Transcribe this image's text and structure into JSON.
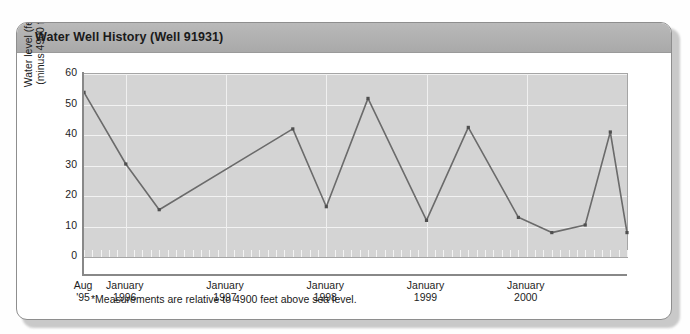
{
  "card": {
    "title": "Water Well History (Well 91931)"
  },
  "footnote": "*Measurements are relative to 4900 feet above sea level.",
  "axes": {
    "y_title_line1": "Water level (feet) *",
    "y_title_line2": "(minus 4900 feet)",
    "y_ticks": [
      "60",
      "50",
      "40",
      "30",
      "20",
      "10",
      "0"
    ]
  },
  "colors": {
    "header_bar": "#b0b0b0",
    "plot_background": "#d4d4d4",
    "gridline": "#f2f2f2",
    "series_line": "#6b6b6b",
    "axis": "#888888",
    "card_border": "#8e8e8e",
    "text": "#1a1a1a"
  },
  "chart_data": {
    "type": "line",
    "title": "Water Well History (Well 91931)",
    "xlabel": "",
    "ylabel": "Water level (feet) * (minus 4900 feet)",
    "ylim": [
      0,
      60
    ],
    "ytick_values": [
      0,
      10,
      20,
      30,
      40,
      50,
      60
    ],
    "grid": true,
    "legend": "none",
    "annotation": "*Measurements are relative to 4900 feet above sea level.",
    "x_tick_labels": [
      {
        "label_line1": "Aug",
        "label_line2": "'95",
        "x": "1995-08"
      },
      {
        "label_line1": "January",
        "label_line2": "1996",
        "x": "1996-01"
      },
      {
        "label_line1": "January",
        "label_line2": "1997",
        "x": "1997-01"
      },
      {
        "label_line1": "January",
        "label_line2": "1998",
        "x": "1998-01"
      },
      {
        "label_line1": "January",
        "label_line2": "1999",
        "x": "1999-01"
      },
      {
        "label_line1": "January",
        "label_line2": "2000",
        "x": "2000-01"
      }
    ],
    "x_axis_range": [
      "1995-08",
      "2001-01"
    ],
    "series": [
      {
        "name": "Water level",
        "points": [
          {
            "x": "1995-08",
            "y": 54
          },
          {
            "x": "1996-01",
            "y": 30.5
          },
          {
            "x": "1996-05",
            "y": 15.5
          },
          {
            "x": "1997-09",
            "y": 42
          },
          {
            "x": "1998-01",
            "y": 16.5
          },
          {
            "x": "1998-06",
            "y": 52
          },
          {
            "x": "1999-01",
            "y": 12
          },
          {
            "x": "1999-06",
            "y": 42.5
          },
          {
            "x": "1999-12",
            "y": 13
          },
          {
            "x": "2000-04",
            "y": 8
          },
          {
            "x": "2000-08",
            "y": 10.5
          },
          {
            "x": "2000-11",
            "y": 41
          },
          {
            "x": "2001-01",
            "y": 8
          }
        ]
      }
    ]
  }
}
